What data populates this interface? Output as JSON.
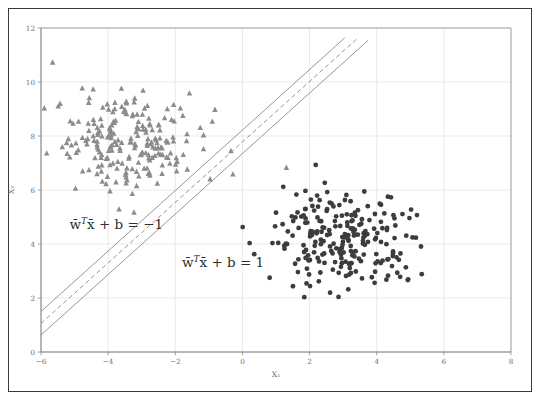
{
  "figure": {
    "title": "",
    "frame_color": "#3a3a3a",
    "background": "#ffffff"
  },
  "chart_data": {
    "type": "scatter",
    "title": "",
    "xlabel": "X₁",
    "ylabel": "X₂",
    "xlim": [
      -6,
      8
    ],
    "ylim": [
      0,
      12
    ],
    "xticks": [
      -6,
      -4,
      -2,
      0,
      2,
      4,
      6,
      8
    ],
    "xticklabels": [
      "−6",
      "−4",
      "−2",
      "0",
      "2",
      "4",
      "6",
      "8"
    ],
    "yticks": [
      0,
      2,
      4,
      6,
      8,
      10,
      12
    ],
    "yticklabels": [
      "0",
      "2",
      "4",
      "6",
      "8",
      "10",
      "12"
    ],
    "grid": true,
    "grid_color": "#e3e3e3",
    "legend": null,
    "legend_position": "none",
    "series": [
      {
        "name": "class-negative",
        "marker": "triangle",
        "color": "#8c8c8c",
        "marker_size": 3.0,
        "center": [
          -3.4,
          7.8
        ],
        "spread": [
          1.15,
          0.95
        ],
        "count": 220,
        "seed": 1337,
        "points": []
      },
      {
        "name": "class-positive",
        "marker": "circle",
        "color": "#3c3c3c",
        "marker_size": 2.4,
        "center": [
          3.0,
          4.1
        ],
        "spread": [
          1.05,
          0.85
        ],
        "count": 230,
        "seed": 24601,
        "points": []
      }
    ],
    "lines": [
      {
        "name": "margin-lower",
        "style": "solid",
        "color": "#8a8a8a",
        "width": 0.9,
        "slope": 1.12,
        "intercept": 7.35,
        "x_start": -6.0,
        "x_end": 3.75
      },
      {
        "name": "decision-boundary",
        "style": "dashed",
        "color": "#8a8a8a",
        "width": 0.9,
        "slope": 1.12,
        "intercept": 7.78,
        "x_start": -6.0,
        "x_end": 3.4
      },
      {
        "name": "margin-upper",
        "style": "solid",
        "color": "#8a8a8a",
        "width": 0.9,
        "slope": 1.12,
        "intercept": 8.22,
        "x_start": -6.0,
        "x_end": 3.05
      }
    ],
    "annotations": [
      {
        "name": "equation-negative-margin",
        "text": "w̄ᵀx̄ + b = −1",
        "parts": {
          "w": "w̄",
          "sup": "T",
          "x": "x̄",
          "rest": "+ b = −1"
        },
        "x": -5.15,
        "y": 4.55
      },
      {
        "name": "equation-positive-margin",
        "text": "w̄ᵀx̄ + b = 1",
        "parts": {
          "w": "w̄",
          "sup": "T",
          "x": "x̄",
          "rest": "+ b = 1"
        },
        "x": -1.8,
        "y": 3.15
      }
    ]
  }
}
